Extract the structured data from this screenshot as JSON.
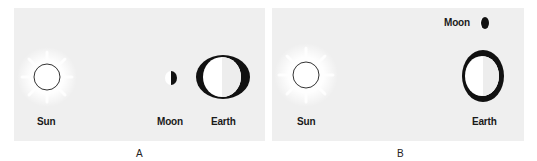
{
  "figure": {
    "panels": [
      {
        "id": "A",
        "caption": "A",
        "labels": {
          "sun": "Sun",
          "moon": "Moon",
          "earth": "Earth"
        },
        "description": "Moon between Sun and Earth, in a line"
      },
      {
        "id": "B",
        "caption": "B",
        "labels": {
          "sun": "Sun",
          "moon": "Moon",
          "earth": "Earth"
        },
        "description": "Moon at right angle to Sun-Earth line"
      }
    ],
    "colors": {
      "panel_bg": "#efefef",
      "ink": "#111111",
      "glow": "#ffffff"
    }
  }
}
